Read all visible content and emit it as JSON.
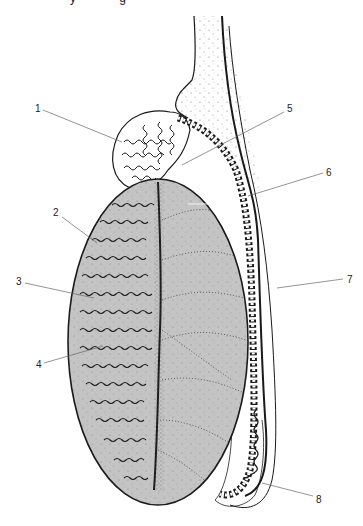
{
  "figure": {
    "type": "anatomical-diagram",
    "cropped_top_text": "y g",
    "colors": {
      "testis_fill": "#c4c4c4",
      "outline": "#1a1a1a",
      "leader_line": "#555555",
      "background": "#ffffff",
      "stipple": "#555555"
    },
    "labels": [
      {
        "id": "1",
        "text": "1",
        "x": 35,
        "y": 104
      },
      {
        "id": "2",
        "text": "2",
        "x": 53,
        "y": 208
      },
      {
        "id": "3",
        "text": "3",
        "x": 16,
        "y": 277
      },
      {
        "id": "4",
        "text": "4",
        "x": 36,
        "y": 360
      },
      {
        "id": "5",
        "text": "5",
        "x": 287,
        "y": 104
      },
      {
        "id": "6",
        "text": "6",
        "x": 326,
        "y": 168
      },
      {
        "id": "7",
        "text": "7",
        "x": 347,
        "y": 275
      },
      {
        "id": "8",
        "text": "8",
        "x": 316,
        "y": 495
      }
    ],
    "leaders": [
      {
        "label": "1",
        "x1": 43,
        "y1": 110,
        "x2": 122,
        "y2": 142
      },
      {
        "label": "2",
        "x1": 62,
        "y1": 217,
        "x2": 97,
        "y2": 243
      },
      {
        "label": "3",
        "x1": 25,
        "y1": 283,
        "x2": 94,
        "y2": 298
      },
      {
        "label": "4",
        "x1": 44,
        "y1": 363,
        "x2": 103,
        "y2": 346
      },
      {
        "label": "5",
        "x1": 284,
        "y1": 112,
        "x2": 182,
        "y2": 165
      },
      {
        "label": "6",
        "x1": 323,
        "y1": 173,
        "x2": 248,
        "y2": 196
      },
      {
        "label": "7",
        "x1": 343,
        "y1": 279,
        "x2": 277,
        "y2": 288
      },
      {
        "label": "8",
        "x1": 313,
        "y1": 496,
        "x2": 262,
        "y2": 483
      }
    ]
  }
}
